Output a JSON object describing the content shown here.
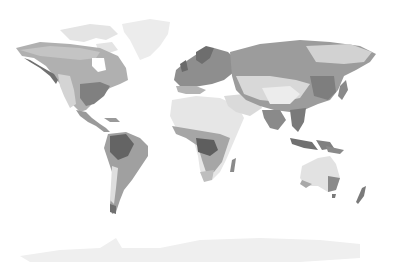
{
  "map": {
    "type": "world-map",
    "style": "grayscale climate zones",
    "background": "#ffffff",
    "shades": {
      "ice": "#ececec",
      "tundra": "#e2e2e2",
      "arid": "#e6e6e6",
      "semiarid": "#d0d0d0",
      "temperate": "#a8a8a8",
      "continental": "#9a9a9a",
      "humid": "#8a8a8a",
      "tropical": "#6e6e6e",
      "rainforest": "#5a5a5a"
    },
    "regions": [
      "north-america",
      "greenland",
      "central-america",
      "south-america",
      "europe",
      "africa",
      "madagascar",
      "asia",
      "southeast-asia",
      "japan",
      "australia",
      "new-zealand",
      "antarctica"
    ]
  }
}
